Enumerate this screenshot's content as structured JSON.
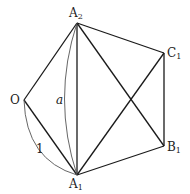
{
  "diagram": {
    "points": {
      "O": {
        "label": "O",
        "sub": "",
        "x": 24,
        "y": 100
      },
      "A1": {
        "label": "A",
        "sub": "1",
        "x": 77,
        "y": 175
      },
      "A2": {
        "label": "A",
        "sub": "2",
        "x": 77,
        "y": 23
      },
      "B1": {
        "label": "B",
        "sub": "1",
        "x": 164,
        "y": 146
      },
      "C1": {
        "label": "C",
        "sub": "1",
        "x": 164,
        "y": 53
      }
    },
    "segments": [
      [
        "O",
        "A2"
      ],
      [
        "O",
        "A1"
      ],
      [
        "A2",
        "A1"
      ],
      [
        "A2",
        "C1"
      ],
      [
        "A2",
        "B1"
      ],
      [
        "A1",
        "C1"
      ],
      [
        "A1",
        "B1"
      ],
      [
        "C1",
        "B1"
      ]
    ],
    "arcs": [
      {
        "from": "A2",
        "to": "A1",
        "label": "a"
      },
      {
        "from": "O",
        "to": "A1",
        "label": "1"
      }
    ],
    "colors": {
      "line": "#1a1a1a",
      "arc": "#555555",
      "text": "#222222"
    }
  }
}
